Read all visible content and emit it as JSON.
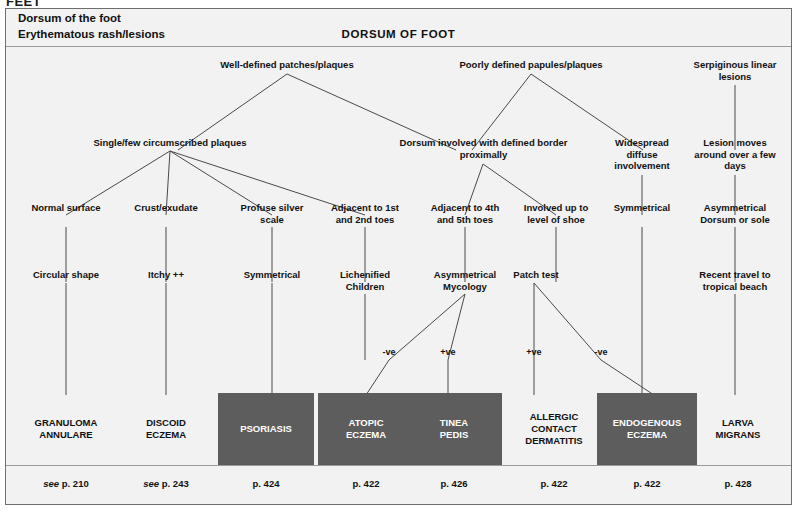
{
  "running_head": "FEET",
  "header": {
    "line1": "Dorsum of the foot",
    "line2": "Erythematous rash/lesions",
    "title": "DORSUM OF FOOT"
  },
  "colors": {
    "box_fill": "#5d5d5d",
    "box_text": "#ffffff",
    "canvas": "#f2f2f2",
    "line": "#4a4a4a",
    "border": "#6e6e6e"
  },
  "nodes": {
    "row1": [
      {
        "id": "well-defined",
        "label": "Well-defined patches/plaques",
        "x": 186,
        "y": 12,
        "w": 190
      },
      {
        "id": "poorly-defined",
        "label": "Poorly defined papules/plaques",
        "x": 425,
        "y": 12,
        "w": 200
      },
      {
        "id": "serpiginous",
        "label": "Serpiginous linear\nlesions",
        "x": 672,
        "y": 12,
        "w": 110
      }
    ],
    "row2": [
      {
        "id": "single-few",
        "label": "Single/few circumscribed plaques",
        "x": 58,
        "y": 90,
        "w": 212
      },
      {
        "id": "dorsum-border",
        "label": "Dorsum involved with defined border\nproximally",
        "x": 360,
        "y": 90,
        "w": 235
      },
      {
        "id": "widespread",
        "label": "Widespread\ndiffuse\ninvolvement",
        "x": 590,
        "y": 90,
        "w": 92
      },
      {
        "id": "lesion-moves",
        "label": "Lesion moves\naround over a few\ndays",
        "x": 676,
        "y": 90,
        "w": 108
      }
    ],
    "row3": [
      {
        "id": "normal-surface",
        "label": "Normal surface",
        "x": 10,
        "y": 155,
        "w": 100
      },
      {
        "id": "crust-exudate",
        "label": "Crust/exudate",
        "x": 110,
        "y": 155,
        "w": 100
      },
      {
        "id": "profuse-silver",
        "label": "Profuse silver\nscale",
        "x": 218,
        "y": 155,
        "w": 96
      },
      {
        "id": "adjacent-1st-2nd",
        "label": "Adjacent to 1st\nand 2nd toes",
        "x": 309,
        "y": 155,
        "w": 100
      },
      {
        "id": "adjacent-4th-5th",
        "label": "Adjacent to 4th\nand 5th toes",
        "x": 409,
        "y": 155,
        "w": 100
      },
      {
        "id": "level-of-shoe",
        "label": "Involved up to\nlevel of shoe",
        "x": 500,
        "y": 155,
        "w": 100
      },
      {
        "id": "symmetrical-r3",
        "label": "Symmetrical",
        "x": 588,
        "y": 155,
        "w": 96
      },
      {
        "id": "asymmetrical-dorsum-sole",
        "label": "Asymmetrical\nDorsum or sole",
        "x": 674,
        "y": 155,
        "w": 110
      }
    ],
    "row4": [
      {
        "id": "circular-shape",
        "label": "Circular shape",
        "x": 10,
        "y": 222,
        "w": 100
      },
      {
        "id": "itchy",
        "label": "Itchy ++",
        "x": 110,
        "y": 222,
        "w": 100
      },
      {
        "id": "symmetrical-r4",
        "label": "Symmetrical",
        "x": 214,
        "y": 222,
        "w": 100
      },
      {
        "id": "lichenified-children",
        "label": "Lichenified\nChildren",
        "x": 309,
        "y": 222,
        "w": 100
      },
      {
        "id": "asymmetrical-mycology",
        "label": "Asymmetrical\nMycology",
        "x": 405,
        "y": 222,
        "w": 100
      },
      {
        "id": "patch-test",
        "label": "Patch test",
        "x": 500,
        "y": 222,
        "w": 100
      },
      {
        "id": "recent-travel",
        "label": "Recent travel to\ntropical beach",
        "x": 674,
        "y": 222,
        "w": 110
      }
    ],
    "tags": [
      {
        "id": "myc-neg",
        "label": "-ve",
        "x": 368,
        "y": 300,
        "w": 30
      },
      {
        "id": "myc-pos",
        "label": "+ve",
        "x": 427,
        "y": 300,
        "w": 30
      },
      {
        "id": "patch-pos",
        "label": "+ve",
        "x": 513,
        "y": 300,
        "w": 30
      },
      {
        "id": "patch-neg",
        "label": "-ve",
        "x": 580,
        "y": 300,
        "w": 30
      }
    ]
  },
  "diagnoses": [
    {
      "id": "granuloma-annulare",
      "label": "GRANULOMA\nANNULARE",
      "filled": false,
      "x": 12,
      "y": 346,
      "w": 96,
      "h": 72
    },
    {
      "id": "discoid-eczema",
      "label": "DISCOID\nECZEMA",
      "filled": false,
      "x": 112,
      "y": 346,
      "w": 96,
      "h": 72
    },
    {
      "id": "psoriasis",
      "label": "PSORIASIS",
      "filled": true,
      "x": 212,
      "y": 346,
      "w": 96,
      "h": 72
    },
    {
      "id": "atopic-eczema",
      "label": "ATOPIC\nECZEMA",
      "filled": true,
      "x": 312,
      "y": 346,
      "w": 96,
      "h": 72
    },
    {
      "id": "tinea-pedis",
      "label": "TINEA\nPEDIS",
      "filled": true,
      "x": 400,
      "y": 346,
      "w": 96,
      "h": 72
    },
    {
      "id": "allergic-contact-dermatitis",
      "label": "ALLERGIC\nCONTACT\nDERMATITIS",
      "filled": false,
      "x": 498,
      "y": 346,
      "w": 100,
      "h": 72
    },
    {
      "id": "endogenous-eczema",
      "label": "ENDOGENOUS\nECZEMA",
      "filled": true,
      "x": 591,
      "y": 346,
      "w": 100,
      "h": 72
    },
    {
      "id": "larva-migrans",
      "label": "LARVA\nMIGRANS",
      "filled": false,
      "x": 684,
      "y": 346,
      "w": 96,
      "h": 72
    }
  ],
  "page_refs": [
    {
      "id": "ref-granuloma",
      "italic": "see ",
      "text": "p. 210",
      "x": 12,
      "y": 432,
      "w": 96
    },
    {
      "id": "ref-discoid",
      "italic": "see ",
      "text": "p. 243",
      "x": 112,
      "y": 432,
      "w": 96
    },
    {
      "id": "ref-psoriasis",
      "italic": "",
      "text": "p. 424",
      "x": 212,
      "y": 432,
      "w": 96
    },
    {
      "id": "ref-atopic",
      "italic": "",
      "text": "p. 422",
      "x": 312,
      "y": 432,
      "w": 96
    },
    {
      "id": "ref-tinea",
      "italic": "",
      "text": "p. 426",
      "x": 400,
      "y": 432,
      "w": 96
    },
    {
      "id": "ref-allergic",
      "italic": "",
      "text": "p. 422",
      "x": 498,
      "y": 432,
      "w": 100
    },
    {
      "id": "ref-endogenous",
      "italic": "",
      "text": "p. 422",
      "x": 591,
      "y": 432,
      "w": 100
    },
    {
      "id": "ref-larva",
      "italic": "",
      "text": "p. 428",
      "x": 684,
      "y": 432,
      "w": 96
    }
  ]
}
